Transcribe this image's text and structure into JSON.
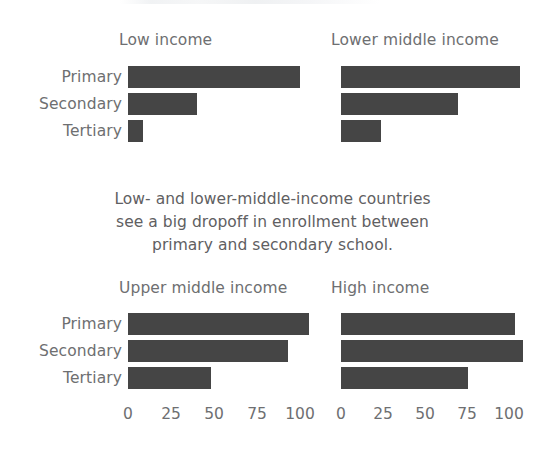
{
  "figure": {
    "caption_lines": [
      "Low- and lower-middle-income countries",
      "see a big dropoff in enrollment between",
      "primary and secondary school."
    ],
    "bar_color": "#454545",
    "text_color": "#6e6f71"
  },
  "chart_data": {
    "type": "bar",
    "orientation": "horizontal",
    "title": "",
    "xlabel": "",
    "ylabel": "",
    "xlim": [
      0,
      115
    ],
    "xticks": [
      0,
      25,
      50,
      75,
      100
    ],
    "xtick_labels": [
      "0",
      "25",
      "50",
      "75",
      "100"
    ],
    "grid": false,
    "legend": "none",
    "categories": [
      "Primary",
      "Secondary",
      "Tertiary"
    ],
    "panels": [
      {
        "title": "Low income",
        "values": [
          100,
          40,
          9
        ],
        "axis_visible": false
      },
      {
        "title": "Lower middle income",
        "values": [
          104,
          68,
          23
        ],
        "axis_visible": false
      },
      {
        "title": "Upper middle income",
        "values": [
          105,
          93,
          48
        ],
        "axis_visible": true
      },
      {
        "title": "High income",
        "values": [
          101,
          106,
          74
        ],
        "axis_visible": true
      }
    ],
    "annotation": "Low- and lower-middle-income countries see a big dropoff in enrollment between primary and secondary school."
  }
}
